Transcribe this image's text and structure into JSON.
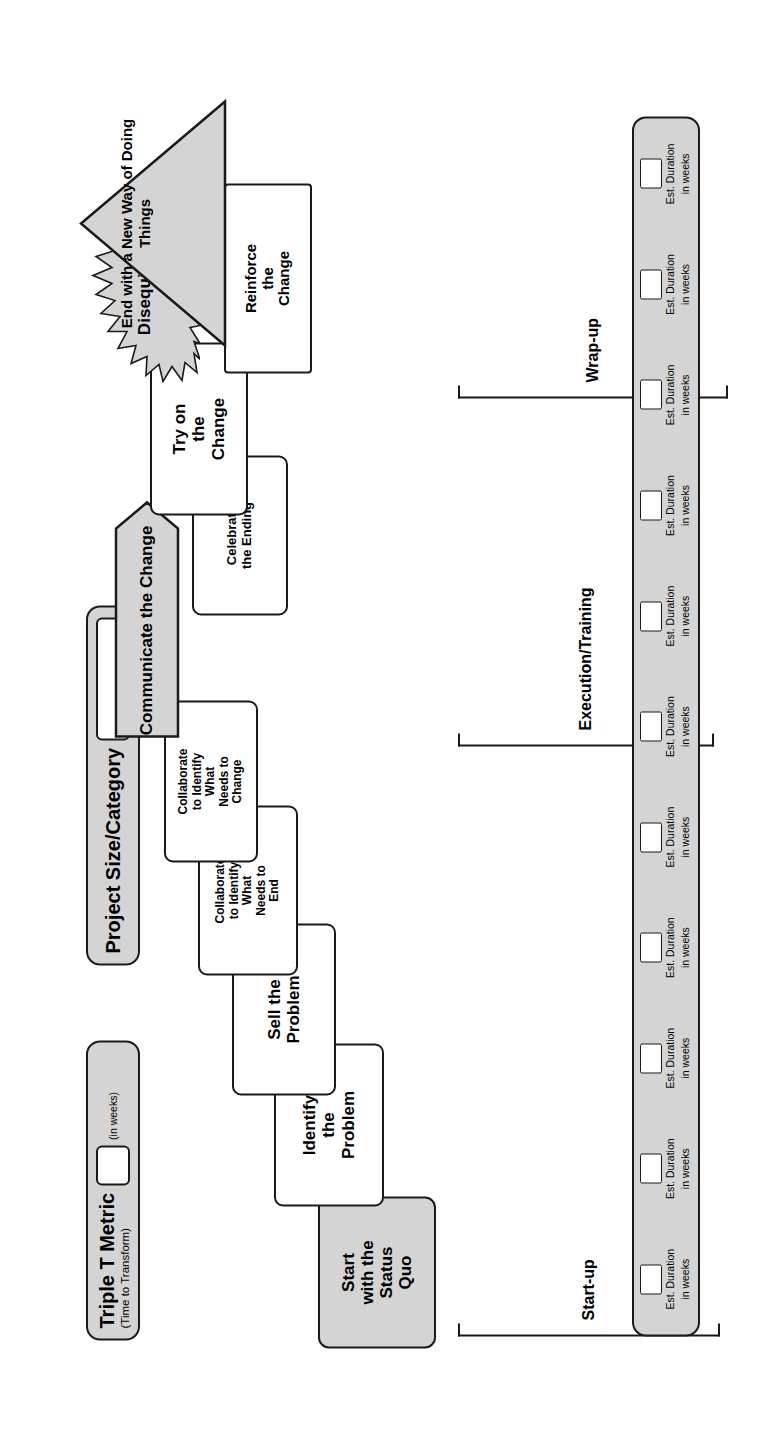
{
  "figure": {
    "number": "Figure 4.3"
  },
  "legends": [
    {
      "id": "triple-t-metric",
      "title": "Triple T Metric",
      "subtitle": "(Time to Transform)",
      "unit": "(in weeks)",
      "value": ""
    },
    {
      "id": "project-size-category",
      "title": "Project Size/Category",
      "subtitle": "",
      "unit": "",
      "value": ""
    }
  ],
  "phases": [
    {
      "id": "start-up",
      "label": "Start-up"
    },
    {
      "id": "execution-training",
      "label": "Execution/Training"
    },
    {
      "id": "wrap-up",
      "label": "Wrap-up"
    }
  ],
  "nodes": [
    {
      "id": "start-with-the-status-quo",
      "lines": [
        "Start",
        "with the",
        "Status",
        "Quo"
      ],
      "shape": "rounded-rect",
      "fill": "gray",
      "font_size": 17
    },
    {
      "id": "identify-the-problem",
      "lines": [
        "Identify",
        "the",
        "Problem"
      ],
      "shape": "rounded-rect",
      "fill": "white",
      "font_size": 17
    },
    {
      "id": "sell-the-problem",
      "lines": [
        "Sell the",
        "Problem"
      ],
      "shape": "rounded-rect",
      "fill": "white",
      "font_size": 17
    },
    {
      "id": "collaborate-to-identify-what-needs-to-end",
      "lines": [
        "Collaborate",
        "to Identify",
        "What",
        "Needs to",
        "End"
      ],
      "shape": "rounded-rect",
      "fill": "white",
      "font_size": 12
    },
    {
      "id": "collaborate-to-identify-what-needs-to-change",
      "lines": [
        "Collaborate",
        "to Identify",
        "What",
        "Needs to",
        "Change"
      ],
      "shape": "rounded-rect",
      "fill": "white",
      "font_size": 12
    },
    {
      "id": "communicate-the-change",
      "lines": [
        "Communicate the Change"
      ],
      "shape": "chevron",
      "fill": "gray",
      "font_size": 17
    },
    {
      "id": "celebrate-the-ending",
      "lines": [
        "Celebrate",
        "the Ending"
      ],
      "shape": "rounded-rect",
      "fill": "white",
      "font_size": 13
    },
    {
      "id": "try-on-the-change",
      "lines": [
        "Try on",
        "the",
        "Change"
      ],
      "shape": "rounded-rect",
      "fill": "white",
      "font_size": 17
    },
    {
      "id": "disequilibrium",
      "lines": [
        "Disequilibrium"
      ],
      "shape": "starburst",
      "fill": "gray",
      "font_size": 17
    },
    {
      "id": "reinforce-the-change",
      "lines": [
        "Reinforce",
        "the",
        "Change"
      ],
      "shape": "rounded-rect",
      "fill": "white",
      "font_size": 15
    },
    {
      "id": "end-with-a-new-way-of-doing-things",
      "lines": [
        "End",
        "with a",
        "New",
        "Way",
        "of",
        "Doing",
        "Things"
      ],
      "shape": "triangle",
      "fill": "gray",
      "font_size": 15
    }
  ],
  "duration_strip": {
    "cell_line1": "Est. Duration",
    "cell_line2": "in weeks",
    "count": 11,
    "values": [
      "",
      "",
      "",
      "",
      "",
      "",
      "",
      "",
      "",
      "",
      ""
    ]
  },
  "colors": {
    "fill_gray": "#d4d4d4",
    "stroke": "#1a1a1a",
    "fill_white": "#ffffff",
    "text": "#000000",
    "page": "#ffffff"
  }
}
